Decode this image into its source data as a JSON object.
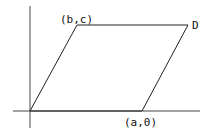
{
  "diagram": {
    "type": "parallelogram-on-axes",
    "colors": {
      "stroke": "#222222",
      "axis": "#444444",
      "background": "#ffffff"
    },
    "axes": {
      "x_axis": {
        "x1": 13,
        "y1": 111,
        "x2": 200,
        "y2": 111
      },
      "y_axis": {
        "x1": 30,
        "y1": 6,
        "x2": 30,
        "y2": 128
      }
    },
    "vertices": {
      "origin": {
        "x": 30,
        "y": 111,
        "label": ""
      },
      "b_c": {
        "x": 77,
        "y": 25,
        "label": "(b,c)"
      },
      "D": {
        "x": 188,
        "y": 25,
        "label": "D"
      },
      "a_0": {
        "x": 142,
        "y": 111,
        "label": "(a,0)"
      }
    },
    "labels": {
      "bc": "(b,c)",
      "d": "D",
      "a0": "(a,0)"
    }
  }
}
